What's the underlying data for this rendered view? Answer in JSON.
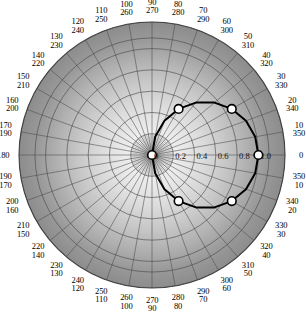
{
  "figure": {
    "type": "polar-plot",
    "title": "",
    "background_color": "#ffffff",
    "plot_fill_inner": "#ececec",
    "plot_fill_outer": "#8a8a8a",
    "grid_color": "#4a4a4a",
    "curve_color": "#000000",
    "marker_fill": "#ffffff",
    "marker_edge": "#000000"
  },
  "chart_data": {
    "type": "line",
    "projection": "polar",
    "title": "",
    "xlabel": "",
    "ylabel": "",
    "rlim": [
      0,
      1.25
    ],
    "rticks": [
      0,
      0.2,
      0.4,
      0.6,
      0.8,
      1.0
    ],
    "rtick_labels": [
      "0",
      "0.2",
      "0.4",
      "0.6",
      "0.8",
      "1.0"
    ],
    "rtick_label_angle_deg": 0,
    "theta_direction": "counterclockwise",
    "theta_zero_location": "E",
    "theta_tick_step_deg": 10,
    "grid": true,
    "legend": "none",
    "angle_tick_labels": [
      {
        "angle": 0,
        "top": "0",
        "bottom": ""
      },
      {
        "angle": 10,
        "top": "10",
        "bottom": "350"
      },
      {
        "angle": 20,
        "top": "20",
        "bottom": "340"
      },
      {
        "angle": 30,
        "top": "30",
        "bottom": "330"
      },
      {
        "angle": 40,
        "top": "40",
        "bottom": "320"
      },
      {
        "angle": 50,
        "top": "50",
        "bottom": "310"
      },
      {
        "angle": 60,
        "top": "60",
        "bottom": "300"
      },
      {
        "angle": 70,
        "top": "70",
        "bottom": "290"
      },
      {
        "angle": 80,
        "top": "80",
        "bottom": "280"
      },
      {
        "angle": 90,
        "top": "90",
        "bottom": "270"
      },
      {
        "angle": 100,
        "top": "100",
        "bottom": "260"
      },
      {
        "angle": 110,
        "top": "110",
        "bottom": "250"
      },
      {
        "angle": 120,
        "top": "120",
        "bottom": "240"
      },
      {
        "angle": 130,
        "top": "130",
        "bottom": "230"
      },
      {
        "angle": 140,
        "top": "140",
        "bottom": "220"
      },
      {
        "angle": 150,
        "top": "150",
        "bottom": "210"
      },
      {
        "angle": 160,
        "top": "160",
        "bottom": "200"
      },
      {
        "angle": 170,
        "top": "170",
        "bottom": "190"
      },
      {
        "angle": 180,
        "top": "180",
        "bottom": ""
      },
      {
        "angle": 190,
        "top": "190",
        "bottom": "170"
      },
      {
        "angle": 200,
        "top": "200",
        "bottom": "160"
      },
      {
        "angle": 210,
        "top": "210",
        "bottom": "150"
      },
      {
        "angle": 220,
        "top": "220",
        "bottom": "140"
      },
      {
        "angle": 230,
        "top": "230",
        "bottom": "130"
      },
      {
        "angle": 240,
        "top": "240",
        "bottom": "120"
      },
      {
        "angle": 250,
        "top": "250",
        "bottom": "110"
      },
      {
        "angle": 260,
        "top": "260",
        "bottom": "100"
      },
      {
        "angle": 270,
        "top": "270",
        "bottom": "90"
      },
      {
        "angle": 280,
        "top": "280",
        "bottom": "80"
      },
      {
        "angle": 290,
        "top": "290",
        "bottom": "70"
      },
      {
        "angle": 300,
        "top": "300",
        "bottom": "60"
      },
      {
        "angle": 310,
        "top": "310",
        "bottom": "50"
      },
      {
        "angle": 320,
        "top": "320",
        "bottom": "40"
      },
      {
        "angle": 330,
        "top": "330",
        "bottom": "30"
      },
      {
        "angle": 340,
        "top": "340",
        "bottom": "20"
      },
      {
        "angle": 350,
        "top": "350",
        "bottom": "10"
      }
    ],
    "series": [
      {
        "name": "pattern",
        "style": "solid",
        "color": "#000000",
        "theta_deg": [
          0,
          10,
          20,
          30,
          40,
          50,
          60,
          70,
          80,
          90,
          100,
          110,
          120,
          130,
          140,
          150,
          160,
          170,
          180,
          190,
          200,
          210,
          220,
          230,
          240,
          250,
          260,
          270,
          280,
          290,
          300,
          310,
          320,
          330,
          340,
          350,
          360
        ],
        "r": [
          1.0,
          0.985,
          0.94,
          0.866,
          0.766,
          0.643,
          0.5,
          0.342,
          0.174,
          0.0,
          0.0,
          0.0,
          0.0,
          0.0,
          0.0,
          0.0,
          0.0,
          0.0,
          0.0,
          0.0,
          0.0,
          0.0,
          0.0,
          0.0,
          0.0,
          0.0,
          0.0,
          0.0,
          0.174,
          0.342,
          0.5,
          0.643,
          0.766,
          0.866,
          0.94,
          0.985,
          1.0
        ]
      }
    ],
    "markers": [
      {
        "theta_deg": 0,
        "r": 1.0,
        "label": ""
      },
      {
        "theta_deg": 30,
        "r": 0.866,
        "label": ""
      },
      {
        "theta_deg": 60,
        "r": 0.5,
        "label": ""
      },
      {
        "theta_deg": 90,
        "r": 0.0,
        "label": ""
      },
      {
        "theta_deg": 300,
        "r": 0.5,
        "label": ""
      },
      {
        "theta_deg": 330,
        "r": 0.866,
        "label": ""
      }
    ]
  }
}
